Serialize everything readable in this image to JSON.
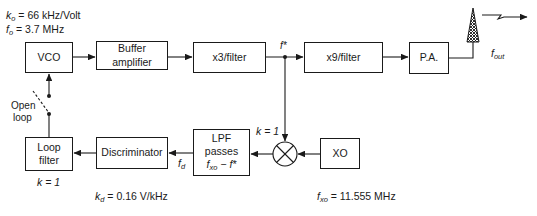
{
  "diagram": {
    "type": "PLL FM transmitter block diagram",
    "params": {
      "ko": {
        "symbol": "k",
        "sub": "o",
        "value": "= 66 kHz/Volt"
      },
      "fo": {
        "symbol": "f",
        "sub": "o",
        "value": "= 3.7 MHz"
      },
      "kd": {
        "symbol": "k",
        "sub": "d",
        "value": "= 0.16 V/kHz"
      },
      "fxo": {
        "symbol": "f",
        "sub": "xo",
        "value": "= 11.555 MHz"
      }
    },
    "blocks": {
      "vco": "VCO",
      "buffer_line1": "Buffer",
      "buffer_line2": "amplifier",
      "x3": "x3/filter",
      "x9": "x9/filter",
      "pa": "P.A.",
      "loop_filter_line1": "Loop",
      "loop_filter_line2": "filter",
      "discriminator": "Discriminator",
      "lpf_line1": "LPF",
      "lpf_line2": "passes",
      "lpf_expr_sym": "f",
      "lpf_expr_sub": "xo",
      "lpf_expr_rest": " − f*",
      "xo": "XO"
    },
    "labels": {
      "fstar": "f*",
      "fout_sym": "f",
      "fout_sub": "out",
      "fd_sym": "f",
      "fd_sub": "d",
      "k_mixer": "k = 1",
      "k_loop": "k = 1",
      "open_line1": "Open",
      "open_line2": "loop"
    }
  }
}
